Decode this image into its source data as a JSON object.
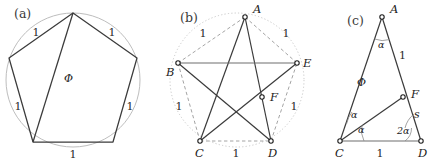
{
  "figure": {
    "width": 431,
    "height": 166,
    "background": "#ffffff",
    "stroke_dark": "#2b2b2b",
    "stroke_mid": "#6e6e6e",
    "stroke_light": "#b6b6b6",
    "vertex_fill": "#ffffff"
  },
  "panels": [
    {
      "id": "a",
      "label": "(a)",
      "caption_x": 14,
      "caption_y": 18,
      "shape": "regular-pentagon-in-circle",
      "circle": {
        "cx": 73,
        "cy": 80,
        "r": 67
      },
      "vertices": [
        {
          "name": "top",
          "x": 73,
          "y": 13
        },
        {
          "name": "upper-right",
          "x": 137,
          "y": 58
        },
        {
          "name": "lower-right",
          "x": 113,
          "y": 142
        },
        {
          "name": "lower-left",
          "x": 33,
          "y": 142
        },
        {
          "name": "upper-left",
          "x": 9,
          "y": 58
        }
      ],
      "diagonal": {
        "from": "top",
        "to": "lower-left"
      },
      "side_labels": [
        {
          "text": "1",
          "x": 36,
          "y": 36
        },
        {
          "text": "1",
          "x": 112,
          "y": 36
        },
        {
          "text": "1",
          "x": 130,
          "y": 110
        },
        {
          "text": "1",
          "x": 18,
          "y": 110
        },
        {
          "text": "1",
          "x": 73,
          "y": 158
        }
      ],
      "diagonal_label": {
        "text": "Φ",
        "x": 64,
        "y": 82
      }
    },
    {
      "id": "b",
      "label": "(b)",
      "caption_x": 180,
      "caption_y": 22,
      "shape": "pentagram",
      "circle": {
        "cx": 237,
        "cy": 80,
        "r": 67
      },
      "vertices": [
        {
          "name": "A",
          "x": 245,
          "y": 17,
          "label": "A",
          "lx": 253,
          "ly": 13
        },
        {
          "name": "B",
          "x": 178,
          "y": 63,
          "label": "B",
          "lx": 166,
          "ly": 76
        },
        {
          "name": "C",
          "x": 200,
          "y": 141,
          "label": "C",
          "lx": 195,
          "ly": 157
        },
        {
          "name": "D",
          "x": 271,
          "y": 141,
          "label": "D",
          "lx": 268,
          "ly": 157
        },
        {
          "name": "E",
          "x": 297,
          "y": 63,
          "label": "E",
          "lx": 303,
          "ly": 67
        }
      ],
      "interior_point": {
        "name": "F",
        "x": 262,
        "y": 97,
        "label": "F",
        "lx": 270,
        "ly": 101
      },
      "star_chords": [
        [
          "A",
          "C"
        ],
        [
          "A",
          "D"
        ],
        [
          "B",
          "D"
        ],
        [
          "B",
          "E"
        ],
        [
          "C",
          "E"
        ]
      ],
      "dashed_sides": [
        [
          "A",
          "B"
        ],
        [
          "B",
          "C"
        ],
        [
          "C",
          "D"
        ],
        [
          "D",
          "E"
        ],
        [
          "E",
          "A"
        ]
      ],
      "side_labels": [
        {
          "text": "1",
          "x": 203,
          "y": 37
        },
        {
          "text": "1",
          "x": 286,
          "y": 37
        },
        {
          "text": "1",
          "x": 179,
          "y": 110
        },
        {
          "text": "1",
          "x": 294,
          "y": 110
        },
        {
          "text": "1",
          "x": 236,
          "y": 157
        }
      ]
    },
    {
      "id": "c",
      "label": "(c)",
      "caption_x": 347,
      "caption_y": 25,
      "shape": "golden-gnomon-triangle",
      "vertices": [
        {
          "name": "A",
          "x": 382,
          "y": 17,
          "label": "A",
          "lx": 390,
          "ly": 13
        },
        {
          "name": "C",
          "x": 340,
          "y": 141,
          "label": "C",
          "lx": 335,
          "ly": 157
        },
        {
          "name": "D",
          "x": 421,
          "y": 141,
          "label": "D",
          "lx": 418,
          "ly": 157
        },
        {
          "name": "F",
          "x": 403,
          "y": 97,
          "label": "F",
          "lx": 411,
          "ly": 98
        }
      ],
      "segments": [
        [
          "A",
          "C"
        ],
        [
          "A",
          "D"
        ],
        [
          "C",
          "D"
        ],
        [
          "C",
          "F"
        ]
      ],
      "edge_labels": [
        {
          "text": "Φ",
          "x": 357,
          "y": 86,
          "name": "side-CA-length"
        },
        {
          "text": "1",
          "x": 399,
          "y": 59,
          "name": "side-AF-length"
        },
        {
          "text": "s",
          "x": 414,
          "y": 118,
          "name": "side-FD-length"
        },
        {
          "text": "1",
          "x": 380,
          "y": 157,
          "name": "side-CD-length"
        }
      ],
      "angle_labels": [
        {
          "text": "α",
          "x": 378,
          "y": 48,
          "name": "angle-at-A"
        },
        {
          "text": "α",
          "x": 351,
          "y": 118,
          "name": "angle-ACF"
        },
        {
          "text": "α",
          "x": 358,
          "y": 133,
          "name": "angle-FCD"
        },
        {
          "text": "2α",
          "x": 397,
          "y": 134,
          "name": "angle-at-D"
        }
      ]
    }
  ]
}
